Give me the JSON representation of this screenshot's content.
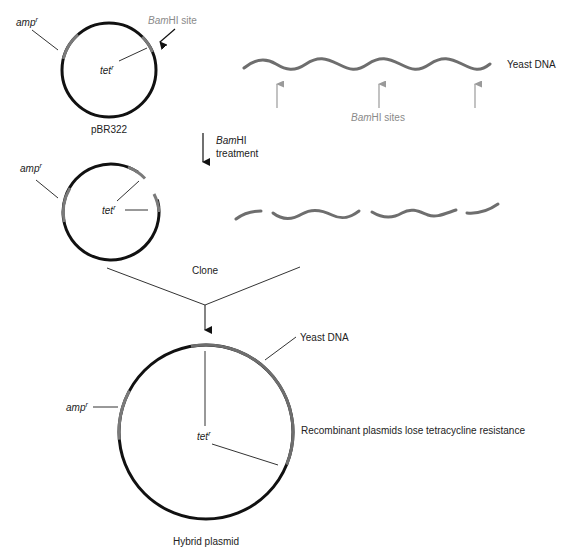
{
  "figure": {
    "step1": {
      "plasmid_name": "pBR322",
      "amp_label": "amp",
      "amp_sup": "r",
      "tet_label": "tet",
      "tet_sup": "r",
      "bamhi_site_italic": "Bam",
      "bamhi_site_rest": "HI site"
    },
    "yeast": {
      "label": "Yeast DNA",
      "sites_italic": "Bam",
      "sites_rest": "HI sites"
    },
    "treatment": {
      "line1_italic": "Bam",
      "line1_rest": "HI",
      "line2": "treatment"
    },
    "step2": {
      "amp_label": "amp",
      "amp_sup": "r",
      "tet_label": "tet",
      "tet_sup": "r"
    },
    "clone_label": "Clone",
    "hybrid": {
      "name": "Hybrid plasmid",
      "yeast_label": "Yeast DNA",
      "amp_label": "amp",
      "amp_sup": "r",
      "tet_label": "tet",
      "tet_sup": "r",
      "note": "Recombinant plasmids lose tetracycline resistance"
    },
    "colors": {
      "plasmid_dna": "#111111",
      "yeast_dna": "#6e6e6e",
      "site_arrow": "#9a9a9a"
    }
  }
}
